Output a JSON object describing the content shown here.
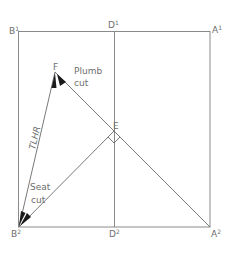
{
  "diagram": {
    "points": {
      "B1": {
        "label": "B",
        "sup": "1",
        "x": 18,
        "y": 31
      },
      "D1": {
        "label": "D",
        "sup": "1",
        "x": 114,
        "y": 31
      },
      "A1": {
        "label": "A",
        "sup": "1",
        "x": 210,
        "y": 31
      },
      "B2": {
        "label": "B",
        "sup": "2",
        "x": 19,
        "y": 227
      },
      "D2": {
        "label": "D",
        "sup": "2",
        "x": 114,
        "y": 227
      },
      "A2": {
        "label": "A",
        "sup": "2",
        "x": 210,
        "y": 227
      },
      "E": {
        "label": "E",
        "x": 114,
        "y": 131
      },
      "F": {
        "label": "F",
        "x": 55,
        "y": 72
      }
    },
    "annotations": {
      "plumb_line1": "Plumb",
      "plumb_line2": "cut",
      "seat_line1": "Seat",
      "seat_line2": "cut",
      "tlhr": "TLHR"
    },
    "colors": {
      "line": "#8a8a8a",
      "text": "#6e6e6e",
      "arrow": "#1a1a1a"
    }
  }
}
